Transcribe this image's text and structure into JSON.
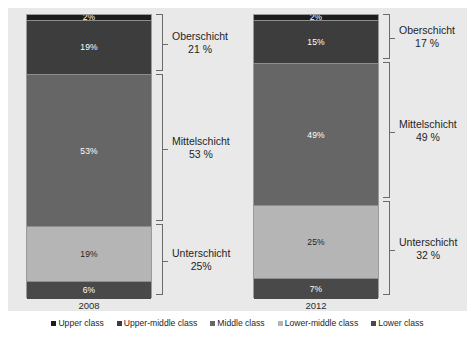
{
  "chart_data": {
    "type": "bar",
    "title": "",
    "subtitle": "",
    "xlabel": "",
    "ylabel": "",
    "ylim": [
      0,
      100
    ],
    "grid": false,
    "stacked": true,
    "orientation": "vertical",
    "legend_position": "bottom",
    "categories": [
      "2008",
      "2012"
    ],
    "series": [
      {
        "name": "Upper class",
        "color": "#1d1d1d",
        "values": [
          2,
          2
        ]
      },
      {
        "name": "Upper-middle class",
        "color": "#3d3d3d",
        "values": [
          19,
          15
        ]
      },
      {
        "name": "Middle class",
        "color": "#666666",
        "values": [
          53,
          49
        ]
      },
      {
        "name": "Lower-middle class",
        "color": "#b5b5b5",
        "values": [
          19,
          25
        ]
      },
      {
        "name": "Lower class",
        "color": "#494949",
        "values": [
          6,
          7
        ]
      }
    ],
    "value_labels": {
      "2008": [
        "2%",
        "19%",
        "53%",
        "19%",
        "6%"
      ],
      "2012": [
        "2%",
        "15%",
        "49%",
        "25%",
        "7%"
      ]
    },
    "annotations": {
      "2008": [
        {
          "name": "Oberschicht",
          "value": "21 %",
          "spans": [
            "Upper class",
            "Upper-middle class"
          ]
        },
        {
          "name": "Mittelschicht",
          "value": "53 %",
          "spans": [
            "Middle class"
          ]
        },
        {
          "name": "Unterschicht",
          "value": "25%",
          "spans": [
            "Lower-middle class",
            "Lower class"
          ]
        }
      ],
      "2012": [
        {
          "name": "Oberschicht",
          "value": "17 %",
          "spans": [
            "Upper class",
            "Upper-middle class"
          ]
        },
        {
          "name": "Mittelschicht",
          "value": "49 %",
          "spans": [
            "Middle class"
          ]
        },
        {
          "name": "Unterschicht",
          "value": "32 %",
          "spans": [
            "Lower-middle class",
            "Lower class"
          ]
        }
      ]
    }
  },
  "groups": [
    {
      "year": "2008",
      "segments": [
        {
          "label": "2%",
          "color": "#1d1d1d",
          "text_color": "#ffffff",
          "pct": 2
        },
        {
          "label": "19%",
          "color": "#3d3d3d",
          "text_color": "#ffffff",
          "pct": 19
        },
        {
          "label": "53%",
          "color": "#666666",
          "text_color": "#ffffff",
          "pct": 53
        },
        {
          "label": "19%",
          "color": "#b5b5b5",
          "text_color": "#1f1f1f",
          "pct": 19
        },
        {
          "label": "6%",
          "color": "#494949",
          "text_color": "#ffffff",
          "pct": 6
        }
      ],
      "brackets": [
        {
          "name": "Oberschicht",
          "value": "21 %",
          "start_pct": 0,
          "span_pct": 21
        },
        {
          "name": "Mittelschicht",
          "value": "53 %",
          "start_pct": 21,
          "span_pct": 53
        },
        {
          "name": "Unterschicht",
          "value": "25%",
          "start_pct": 74,
          "span_pct": 26
        }
      ]
    },
    {
      "year": "2012",
      "segments": [
        {
          "label": "2%",
          "color": "#1d1d1d",
          "text_color": "#ffffff",
          "pct": 2
        },
        {
          "label": "15%",
          "color": "#3d3d3d",
          "text_color": "#ffffff",
          "pct": 15
        },
        {
          "label": "49%",
          "color": "#666666",
          "text_color": "#ffffff",
          "pct": 49
        },
        {
          "label": "25%",
          "color": "#b5b5b5",
          "text_color": "#1f1f1f",
          "pct": 25
        },
        {
          "label": "7%",
          "color": "#494949",
          "text_color": "#ffffff",
          "pct": 7
        }
      ],
      "brackets": [
        {
          "name": "Oberschicht",
          "value": "17 %",
          "start_pct": 0,
          "span_pct": 17
        },
        {
          "name": "Mittelschicht",
          "value": "49 %",
          "start_pct": 17,
          "span_pct": 49
        },
        {
          "name": "Unterschicht",
          "value": "32 %",
          "start_pct": 66,
          "span_pct": 34
        }
      ]
    }
  ],
  "legend": {
    "items": [
      {
        "label": "Upper class",
        "color": "#1d1d1d"
      },
      {
        "label": "Upper-middle class",
        "color": "#3d3d3d"
      },
      {
        "label": "Middle class",
        "color": "#666666"
      },
      {
        "label": "Lower-middle class",
        "color": "#b5b5b5"
      },
      {
        "label": "Lower class",
        "color": "#494949"
      }
    ]
  },
  "colors": {
    "plot_background": "#e9e9e9",
    "page_background": "#ffffff",
    "bar_border": "#9a9a9a",
    "bracket_line": "#6a6a6a"
  }
}
